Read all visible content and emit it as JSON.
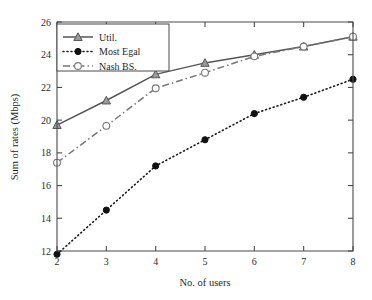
{
  "chart_data": {
    "type": "line",
    "title": "",
    "xlabel": "No. of users",
    "ylabel": "Sum of rates (Mbps)",
    "x": [
      2,
      3,
      4,
      5,
      6,
      7,
      8
    ],
    "xlim": [
      2,
      8
    ],
    "ylim": [
      12,
      26
    ],
    "xticks": [
      "2",
      "3",
      "4",
      "5",
      "6",
      "7",
      "8"
    ],
    "yticks": [
      "12",
      "14",
      "16",
      "18",
      "20",
      "22",
      "24",
      "26"
    ],
    "grid": false,
    "legend_position": "upper-left",
    "series": [
      {
        "name": "Util.",
        "values": [
          19.7,
          21.2,
          22.8,
          23.5,
          24.0,
          24.5,
          25.1
        ],
        "linestyle": "solid",
        "marker": "triangle",
        "marker_fill": "gray",
        "color": "#555555"
      },
      {
        "name": "Most Egal",
        "values": [
          11.8,
          14.5,
          17.2,
          18.8,
          20.4,
          21.4,
          22.5
        ],
        "linestyle": "dotted",
        "marker": "circle",
        "marker_fill": "black",
        "color": "#1a1a1a"
      },
      {
        "name": "Nash BS.",
        "values": [
          17.4,
          19.65,
          21.95,
          22.9,
          23.9,
          24.5,
          25.1
        ],
        "linestyle": "dashdot",
        "marker": "circle-open",
        "marker_fill": "white",
        "color": "#777777"
      }
    ]
  },
  "figure": {
    "background_color": "#ffffff",
    "axis_color": "#4a4a4a"
  }
}
